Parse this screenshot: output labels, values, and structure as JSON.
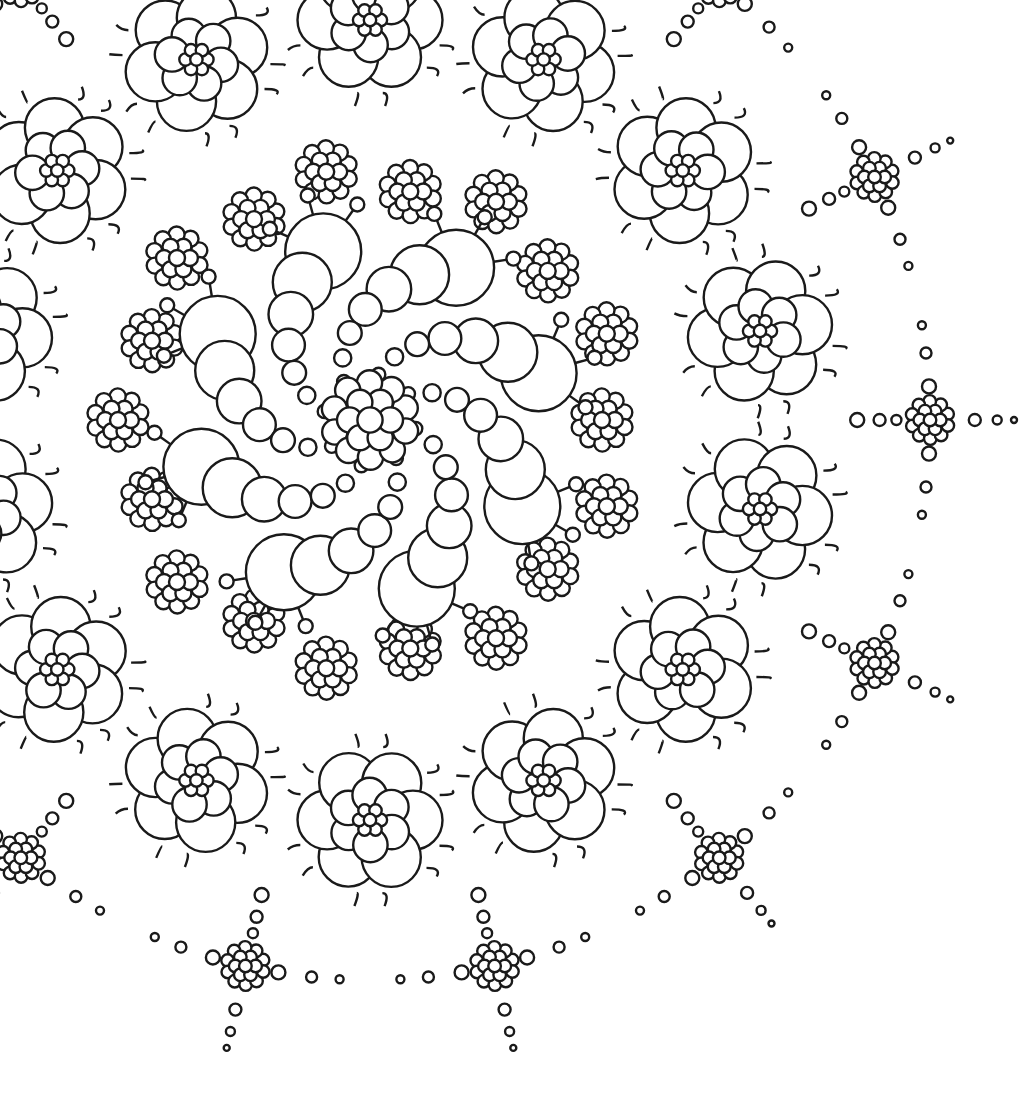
{
  "image": {
    "description": "Black and white line-art mandala coloring page",
    "background": "#ffffff",
    "line_color": "#1a1a1a",
    "width": 1028,
    "height": 1112
  },
  "mandala": {
    "center": [
      370,
      420
    ],
    "spiral_arms": 8,
    "cluster_ring": {
      "count": 18,
      "radius": 240,
      "cluster_size": 38
    },
    "flower_ring": {
      "count": 14,
      "radius": 400,
      "petals": 6,
      "flower_radius": 78
    },
    "outer_dots": {
      "count": 14,
      "radius": 560
    }
  }
}
